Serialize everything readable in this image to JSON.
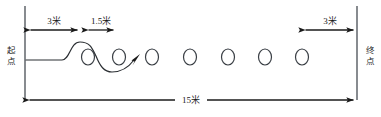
{
  "diagram": {
    "type": "slalom-dribbling-course",
    "canvas": {
      "width": 381,
      "height": 117,
      "background": "#ffffff"
    },
    "labels": {
      "start": "起点",
      "finish": "终点",
      "first_gap": "3米",
      "cone_spacing": "1.5米",
      "last_gap": "3米",
      "total_length": "15米"
    },
    "dimensions": [
      {
        "id": "first-gap",
        "text": "3米",
        "x1": 28,
        "x2": 80,
        "y": 30,
        "label_x": 54,
        "label_y": 24
      },
      {
        "id": "cone-spacing",
        "text": "1.5米",
        "x1": 86,
        "x2": 116,
        "y": 30,
        "label_x": 101,
        "label_y": 24
      },
      {
        "id": "last-gap",
        "text": "3米",
        "x1": 303,
        "x2": 356,
        "y": 30,
        "label_x": 330,
        "label_y": 24
      },
      {
        "id": "total-length",
        "text": "15米",
        "x1": 27,
        "x2": 356,
        "y": 100,
        "label_x": 191,
        "label_y": 103
      }
    ],
    "boundaries": [
      {
        "id": "start-line",
        "x": 25,
        "y1": 6,
        "y2": 100
      },
      {
        "id": "finish-line",
        "x": 357,
        "y1": 6,
        "y2": 100
      }
    ],
    "cones": [
      {
        "index": 1,
        "cx": 88,
        "cy": 57
      },
      {
        "index": 2,
        "cx": 119,
        "cy": 57
      },
      {
        "index": 3,
        "cx": 152,
        "cy": 57
      },
      {
        "index": 4,
        "cx": 190,
        "cy": 57
      },
      {
        "index": 5,
        "cx": 228,
        "cy": 57
      },
      {
        "index": 6,
        "cx": 265,
        "cy": 57
      },
      {
        "index": 7,
        "cx": 302,
        "cy": 57
      }
    ],
    "cone_shape": {
      "rx": 6.5,
      "ry": 8
    },
    "route": {
      "description": "weaving S-curve from start through first two cones ending with arrow",
      "arrow_tip": {
        "x": 140,
        "y": 55
      }
    },
    "colors": {
      "ink": "#1a1a1a",
      "cone_stroke": "#3a3f45",
      "boundary_stroke": "#555a60",
      "background": "#ffffff"
    }
  }
}
